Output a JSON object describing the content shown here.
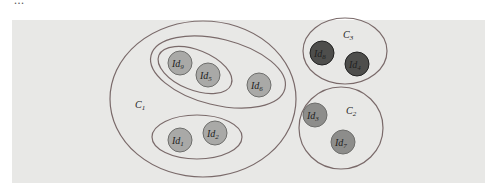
{
  "top_text": "...",
  "diagram": {
    "colors": {
      "background": "#e8e8e6",
      "outline": "#7a6a6a",
      "node_light": "#a9a9a7",
      "node_mid": "#8d8d8b",
      "node_dark": "#4e4e4c"
    },
    "clusters": [
      {
        "id": "C1",
        "label": "C",
        "sub": "1"
      },
      {
        "id": "C2",
        "label": "C",
        "sub": "2"
      },
      {
        "id": "C3",
        "label": "C",
        "sub": "3"
      }
    ],
    "nodes": [
      {
        "id": "Id9",
        "label": "Id",
        "sub": "9",
        "cluster": "C1"
      },
      {
        "id": "Id5",
        "label": "Id",
        "sub": "5",
        "cluster": "C1"
      },
      {
        "id": "Id6",
        "label": "Id",
        "sub": "6",
        "cluster": "C1"
      },
      {
        "id": "Id1",
        "label": "Id",
        "sub": "1",
        "cluster": "C1"
      },
      {
        "id": "Id2",
        "label": "Id",
        "sub": "2",
        "cluster": "C1"
      },
      {
        "id": "Id8",
        "label": "Id",
        "sub": "8",
        "cluster": "C3"
      },
      {
        "id": "Id4",
        "label": "Id",
        "sub": "4",
        "cluster": "C3"
      },
      {
        "id": "Id3",
        "label": "Id",
        "sub": "3",
        "cluster": "C2"
      },
      {
        "id": "Id7",
        "label": "Id",
        "sub": "7",
        "cluster": "C2"
      }
    ]
  }
}
